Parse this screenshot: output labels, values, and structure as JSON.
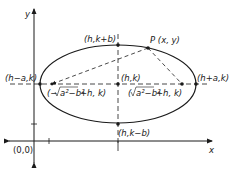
{
  "diagram": {
    "type": "ellipse-geometry",
    "axes": {
      "x_label": "x",
      "y_label": "y",
      "origin_label": "(0,0)"
    },
    "center": {
      "label": "(h,k)"
    },
    "vertices": {
      "left": {
        "label": "(h−a,k)"
      },
      "right": {
        "label": "(h+a,k)"
      }
    },
    "co_vertices": {
      "top": {
        "label": "(h,k+b)"
      },
      "bottom": {
        "label": "(h,k−b)"
      }
    },
    "foci": {
      "left": {
        "label_prefix": "(−",
        "radical": "a²−b²",
        "label_suffix": "+h, k)"
      },
      "right": {
        "label_prefix": "(",
        "radical": "a²−b²",
        "label_suffix": "+h, k)"
      }
    },
    "point": {
      "label": "P (x, y)"
    },
    "colors": {
      "ink": "#1a1a1a",
      "background": "#ffffff"
    }
  }
}
